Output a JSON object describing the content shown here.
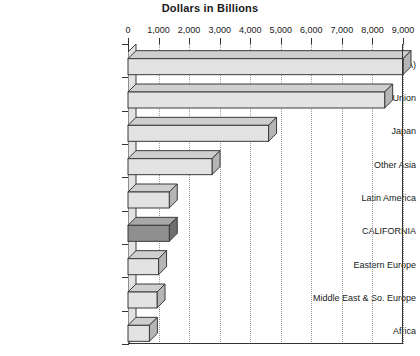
{
  "chart_data": {
    "type": "bar",
    "orientation": "horizontal",
    "title": "Dollars in Billions",
    "xlabel": "",
    "ylabel": "",
    "xlim": [
      0,
      9000
    ],
    "xticks": [
      0,
      1000,
      2000,
      3000,
      4000,
      5000,
      6000,
      7000,
      8000,
      9000
    ],
    "xtick_labels": [
      "0",
      "1,000",
      "2,000",
      "3,000",
      "4,000",
      "5,000",
      "6,000",
      "7,000",
      "8,000",
      "9,000"
    ],
    "grid": "vertical-dotted",
    "legend": null,
    "style": "3d-bar",
    "categories": [
      "North America (NAFTA)",
      "European Union",
      "Japan",
      "Other Asia",
      "Latin America",
      "CALIFORNIA",
      "Eastern Europe",
      "Middle East & So. Europe",
      "Africa"
    ],
    "values": [
      9000,
      8400,
      4600,
      2750,
      1350,
      1350,
      1000,
      950,
      700
    ],
    "highlight_category": "CALIFORNIA",
    "colors": {
      "bar_fill": "#E3E3E3",
      "bar_top": "#CFCFCF",
      "bar_side": "#B5B5B5",
      "highlight_fill": "#8F8F8F",
      "highlight_top": "#A8A8A8",
      "highlight_side": "#6E6E6E",
      "bar_edge": "#3A3A3A",
      "axis": "#333333",
      "gridline": "#9A9A9A",
      "text": "#1A1A1A",
      "background": "#FFFFFF"
    }
  }
}
